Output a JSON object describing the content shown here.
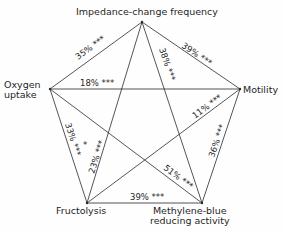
{
  "diagram": {
    "type": "pentagram-correlation",
    "nodes": [
      {
        "id": "impedance",
        "label": "Impedance-change frequency",
        "x": 142,
        "y": 22
      },
      {
        "id": "oxygen",
        "label_lines": [
          "Oxygen",
          "uptake"
        ],
        "x": 50,
        "y": 89
      },
      {
        "id": "motility",
        "label": "Motility",
        "x": 240,
        "y": 89
      },
      {
        "id": "fructolysis",
        "label": "Fructolysis",
        "x": 87,
        "y": 203
      },
      {
        "id": "methylene",
        "label_lines": [
          "Methylene-blue",
          "reducing activity"
        ],
        "x": 202,
        "y": 203
      }
    ],
    "edges": [
      {
        "from": "impedance",
        "to": "oxygen",
        "label": "35% ***"
      },
      {
        "from": "impedance",
        "to": "motility",
        "label": "39% ***"
      },
      {
        "from": "impedance",
        "to": "methylene",
        "label": "38% ***"
      },
      {
        "from": "impedance",
        "to": "fructolysis",
        "label": ""
      },
      {
        "from": "oxygen",
        "to": "motility",
        "label": "18% ***"
      },
      {
        "from": "oxygen",
        "to": "fructolysis",
        "label": "33% ***"
      },
      {
        "from": "oxygen",
        "to": "methylene",
        "label": "51% ***"
      },
      {
        "from": "motility",
        "to": "fructolysis",
        "label": "11% ***"
      },
      {
        "from": "motility",
        "to": "methylene",
        "label": "36% ***"
      },
      {
        "from": "fructolysis",
        "to": "methylene",
        "label": "39% ***"
      }
    ],
    "inner_labels": [
      {
        "label": "23% ***",
        "note": "inner diagonal near Fructolysis"
      },
      {
        "label": "*",
        "note": "single asterisk near 23%"
      }
    ],
    "colors": {
      "line": "#2a2a2a",
      "text": "#1e1e1e",
      "background": "#fefefe"
    }
  }
}
